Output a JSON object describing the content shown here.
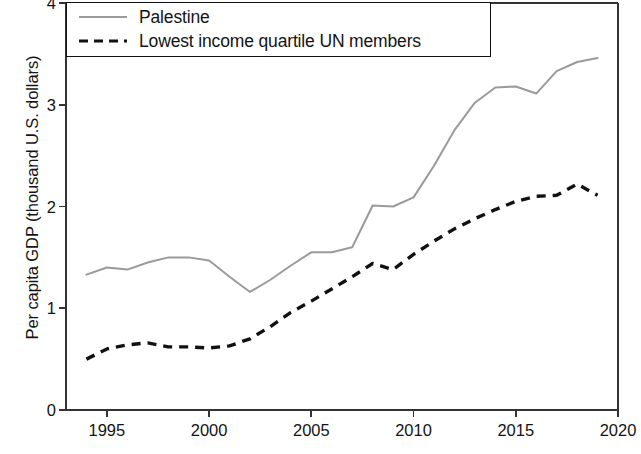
{
  "chart_data": {
    "type": "line",
    "title": "",
    "subtitle": "",
    "xlabel": "",
    "ylabel": "Per capita GDP (thousand U.S. dollars)",
    "xlim": [
      1993,
      2020
    ],
    "ylim": [
      0,
      4
    ],
    "xticks": [
      1995,
      2000,
      2005,
      2010,
      2015,
      2020
    ],
    "yticks": [
      0,
      1,
      2,
      3,
      4
    ],
    "xtick_labels": [
      "1995",
      "2000",
      "2005",
      "2010",
      "2015",
      "2020"
    ],
    "ytick_labels": [
      "0",
      "1",
      "2",
      "3",
      "4"
    ],
    "grid": false,
    "legend_position": "top-left",
    "x": [
      1994,
      1995,
      1996,
      1997,
      1998,
      1999,
      2000,
      2001,
      2002,
      2003,
      2004,
      2005,
      2006,
      2007,
      2008,
      2009,
      2010,
      2011,
      2012,
      2013,
      2014,
      2015,
      2016,
      2017,
      2018,
      2019
    ],
    "series": [
      {
        "name": "Palestine",
        "style": "solid",
        "color": "#9a9a9a",
        "values": [
          1.33,
          1.4,
          1.38,
          1.45,
          1.5,
          1.5,
          1.47,
          1.31,
          1.16,
          1.28,
          1.42,
          1.55,
          1.55,
          1.6,
          2.01,
          2.0,
          2.09,
          2.4,
          2.75,
          3.02,
          3.17,
          3.18,
          3.11,
          3.33,
          3.42,
          3.46
        ]
      },
      {
        "name": "Lowest income quartile UN members",
        "style": "dashed",
        "color": "#111111",
        "values": [
          0.5,
          0.6,
          0.64,
          0.66,
          0.62,
          0.62,
          0.61,
          0.63,
          0.7,
          0.82,
          0.96,
          1.07,
          1.19,
          1.31,
          1.44,
          1.38,
          1.53,
          1.66,
          1.78,
          1.88,
          1.97,
          2.05,
          2.1,
          2.11,
          2.22,
          2.11
        ]
      }
    ]
  },
  "legend": {
    "items": [
      {
        "label": "Palestine",
        "style": "solid",
        "color": "#9a9a9a"
      },
      {
        "label": "Lowest income quartile UN members",
        "style": "dashed",
        "color": "#111111"
      }
    ]
  },
  "axes": {
    "y_axis_title": "Per capita GDP (thousand U.S. dollars)",
    "x_axis_title": ""
  }
}
